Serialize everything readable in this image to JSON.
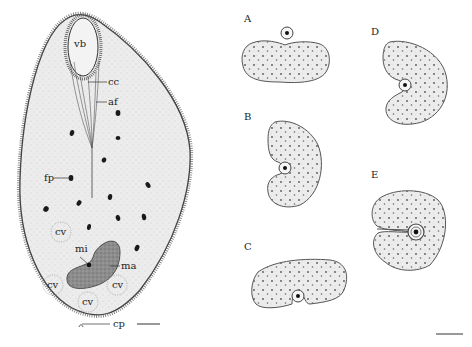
{
  "figure": {
    "main_cell": {
      "labels": {
        "vb": "vb",
        "cc": "cc",
        "af": "af",
        "fp": "fp",
        "cv1": "cv",
        "cv2": "cv",
        "cv3": "cv",
        "cv4": "cv",
        "mi": "mi",
        "ma": "ma",
        "cp": "cp"
      }
    },
    "panels": [
      {
        "id": "A",
        "label": "A"
      },
      {
        "id": "B",
        "label": "B"
      },
      {
        "id": "C",
        "label": "C"
      },
      {
        "id": "D",
        "label": "D"
      },
      {
        "id": "E",
        "label": "E"
      }
    ],
    "colors": {
      "outline": "#3a3a3a",
      "cell_fill": "#efefef",
      "macronucleus_fill": "#8a8a8a",
      "food_particle": "#1a1a1a",
      "cilia": "#555555"
    }
  }
}
